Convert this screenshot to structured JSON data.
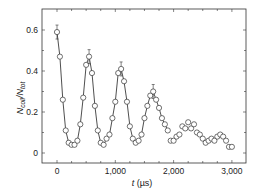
{
  "chart_data": {
    "type": "scatter",
    "title": "",
    "xlabel": "t (µs)",
    "ylabel": "N_coll/N_tot",
    "ylabel_parts": {
      "main": "N",
      "sub1": "coll",
      "sep": "/N",
      "sub2": "tot"
    },
    "xlabel_parts": {
      "var": "t",
      "unit": " (µs)"
    },
    "xlim": [
      -250,
      3250
    ],
    "ylim": [
      -0.05,
      0.7
    ],
    "xticks": [
      0,
      1000,
      2000,
      3000
    ],
    "xtick_labels": [
      "0",
      "1,000",
      "2,000",
      "3,000"
    ],
    "yticks": [
      0,
      0.2,
      0.4,
      0.6
    ],
    "ytick_labels": [
      "0",
      "0.2",
      "0.4",
      "0.6"
    ],
    "grid": false,
    "legend": null,
    "marker": "open-circle",
    "marker_color": "#333333",
    "line_color": "#222222",
    "series": [
      {
        "name": "measured",
        "x": [
          0,
          50,
          100,
          150,
          200,
          250,
          300,
          350,
          400,
          450,
          500,
          550,
          600,
          650,
          700,
          750,
          800,
          850,
          900,
          950,
          1000,
          1050,
          1100,
          1150,
          1200,
          1250,
          1300,
          1350,
          1400,
          1450,
          1500,
          1550,
          1600,
          1650,
          1700,
          1750,
          1800,
          1850,
          1900,
          1950,
          2000,
          2050,
          2100,
          2150,
          2200,
          2250,
          2300,
          2350,
          2400,
          2450,
          2500,
          2550,
          2600,
          2650,
          2700,
          2750,
          2800,
          2850,
          2900,
          2950,
          3000
        ],
        "y": [
          0.59,
          0.47,
          0.26,
          0.11,
          0.05,
          0.04,
          0.04,
          0.06,
          0.14,
          0.27,
          0.43,
          0.47,
          0.39,
          0.23,
          0.11,
          0.05,
          0.04,
          0.07,
          0.09,
          0.17,
          0.25,
          0.39,
          0.41,
          0.35,
          0.25,
          0.13,
          0.07,
          0.05,
          0.06,
          0.09,
          0.17,
          0.23,
          0.28,
          0.3,
          0.26,
          0.22,
          0.17,
          0.14,
          0.11,
          0.06,
          0.06,
          0.08,
          0.09,
          0.13,
          0.12,
          0.15,
          0.12,
          0.14,
          0.1,
          0.09,
          0.07,
          0.05,
          0.06,
          0.07,
          0.06,
          0.08,
          0.09,
          0.08,
          0.06,
          0.03,
          0.03
        ],
        "error_bar_points": [
          0,
          550,
          1100,
          1650
        ]
      },
      {
        "name": "fit",
        "type": "line",
        "x_range": [
          0,
          1900
        ]
      }
    ]
  }
}
